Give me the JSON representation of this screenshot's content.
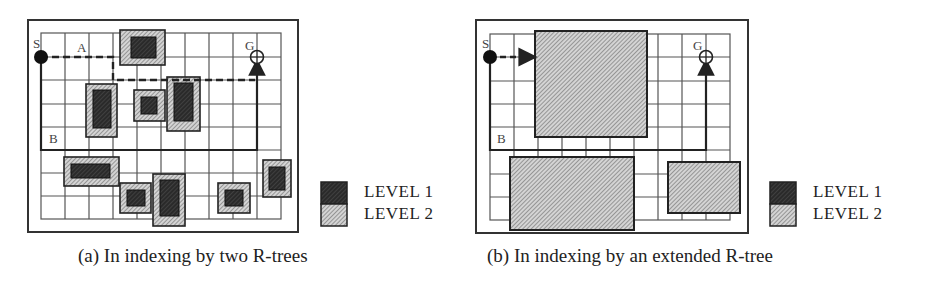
{
  "figure_a": {
    "caption": "(a) In indexing by two R-trees",
    "labels": {
      "start": "S",
      "goal": "G",
      "path_a": "A",
      "path_b": "B"
    },
    "grid": {
      "cols": 10,
      "rows": 8
    },
    "obstacles": [
      {
        "outer": [
          120,
          30,
          45,
          35
        ],
        "inner": [
          131,
          37,
          25,
          21
        ]
      },
      {
        "outer": [
          86,
          84,
          31,
          53
        ],
        "inner": [
          93,
          90,
          18,
          38
        ]
      },
      {
        "outer": [
          134,
          90,
          31,
          31
        ],
        "inner": [
          141,
          97,
          16,
          17
        ]
      },
      {
        "outer": [
          167,
          77,
          33,
          54
        ],
        "inner": [
          174,
          83,
          19,
          38
        ]
      },
      {
        "outer": [
          64,
          157,
          55,
          29
        ],
        "inner": [
          71,
          164,
          39,
          14
        ]
      },
      {
        "outer": [
          120,
          183,
          31,
          30
        ],
        "inner": [
          127,
          190,
          18,
          16
        ]
      },
      {
        "outer": [
          153,
          174,
          32,
          52
        ],
        "inner": [
          160,
          180,
          19,
          36
        ]
      },
      {
        "outer": [
          218,
          183,
          32,
          30
        ],
        "inner": [
          225,
          190,
          18,
          16
        ]
      },
      {
        "outer": [
          263,
          160,
          28,
          37
        ],
        "inner": [
          269,
          167,
          16,
          23
        ]
      }
    ],
    "legend": {
      "level1": "LEVEL 1",
      "level2": "LEVEL 2"
    }
  },
  "figure_b": {
    "caption": "(b) In indexing by an extended R-tree",
    "labels": {
      "start": "S",
      "goal": "G",
      "path_b": "B"
    },
    "grid": {
      "cols": 10,
      "rows": 8
    },
    "obstacles": [
      {
        "outer": [
          535,
          31,
          112,
          106
        ]
      },
      {
        "outer": [
          510,
          157,
          124,
          73
        ]
      },
      {
        "outer": [
          668,
          162,
          72,
          51
        ]
      }
    ],
    "legend": {
      "level1": "LEVEL 1",
      "level2": "LEVEL 2"
    }
  },
  "colors": {
    "level1": "#3a3a3a",
    "level2": "#b8b8b8",
    "line": "#222222",
    "grid": "#555555"
  }
}
